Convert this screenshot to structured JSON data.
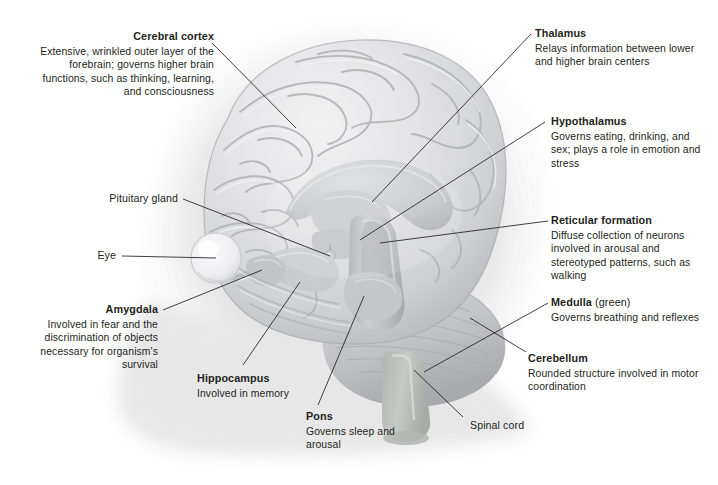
{
  "figure": {
    "type": "anatomical-diagram",
    "background_color": "#ffffff",
    "text_color": "#231f20",
    "leader_line_color": "#231f20",
    "artwork_palette": {
      "cortex_light": "#e9e9ea",
      "cortex_mid": "#d2d3d5",
      "cortex_shadow": "#b9babd",
      "deep_structure": "#c4c5c8",
      "brainstem": "#bdbec1",
      "cerebellum": "#c9cacd",
      "medulla_green": "#b9bdb9",
      "eye_highlight": "#f4f4f5",
      "drop_shadow": "#e3e3e4"
    }
  },
  "callouts": [
    {
      "id": "cerebral-cortex",
      "title": "Cerebral cortex",
      "sub": "",
      "body": "Extensive, wrinkled outer layer of the forebrain; governs higher brain functions, such as thinking, learning, and consciousness",
      "align": "right"
    },
    {
      "id": "thalamus",
      "title": "Thalamus",
      "sub": "",
      "body": "Relays information between lower and higher brain centers",
      "align": "left"
    },
    {
      "id": "hypothalamus",
      "title": "Hypothalamus",
      "sub": "",
      "body": "Governs eating, drinking, and sex; plays a role in emotion and stress",
      "align": "left"
    },
    {
      "id": "reticular-formation",
      "title": "Reticular formation",
      "sub": "",
      "body": "Diffuse collection of neurons involved in arousal and stereotyped patterns, such as walking",
      "align": "left"
    },
    {
      "id": "medulla",
      "title": "Medulla",
      "sub": " (green)",
      "body": "Governs breathing and reflexes",
      "align": "left"
    },
    {
      "id": "cerebellum",
      "title": "Cerebellum",
      "sub": "",
      "body": "Rounded structure involved in motor coordination",
      "align": "left"
    },
    {
      "id": "pituitary-gland",
      "title": "Pituitary gland",
      "sub": "",
      "body": "",
      "align": "right"
    },
    {
      "id": "eye",
      "title": "Eye",
      "sub": "",
      "body": "",
      "align": "right"
    },
    {
      "id": "amygdala",
      "title": "Amygdala",
      "sub": "",
      "body": "Involved in fear and the discrimination of objects necessary for organism's survival",
      "align": "right"
    },
    {
      "id": "hippocampus",
      "title": "Hippocampus",
      "sub": "",
      "body": "Involved in memory",
      "align": "left"
    },
    {
      "id": "pons",
      "title": "Pons",
      "sub": "",
      "body": "Governs sleep and arousal",
      "align": "left"
    },
    {
      "id": "spinal-cord",
      "title": "Spinal cord",
      "sub": "",
      "body": "",
      "align": "left"
    }
  ]
}
